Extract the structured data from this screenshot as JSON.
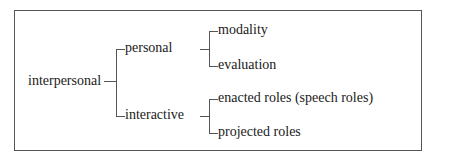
{
  "diagram": {
    "root": "interpersonal",
    "branches": [
      {
        "label": "personal",
        "children": [
          "modality",
          "evaluation"
        ]
      },
      {
        "label": "interactive",
        "children": [
          "enacted roles (speech roles)",
          "projected roles"
        ]
      }
    ]
  }
}
